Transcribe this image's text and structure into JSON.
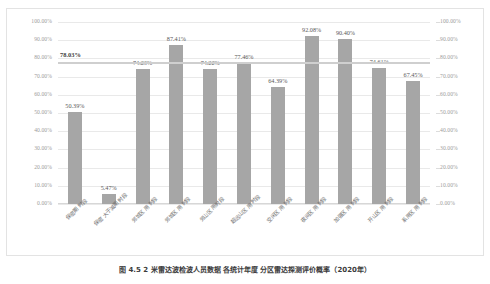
{
  "chart_data": {
    "type": "bar",
    "title": "",
    "xlabel": "",
    "ylabel": "",
    "ylim": [
      0,
      100
    ],
    "y_right_lim": [
      0,
      100
    ],
    "grid": true,
    "legend": "none",
    "value_suffix": "%",
    "categories": [
      "保密期 时段",
      "保密 大于减期 时段",
      "郊城区 用 时段",
      "郊城区 用 时段",
      "郊山区 用时段",
      "超远山区 用 时段",
      "空闲区 用 时段",
      "夜间区 用 时段",
      "加强区 用 时段",
      "开山区 用 时段",
      "系用区 用 时段"
    ],
    "values": [
      50.39,
      5.47,
      74.23,
      87.41,
      74.22,
      77.46,
      64.39,
      92.08,
      90.4,
      74.61,
      67.45
    ],
    "value_labels": [
      "50.39%",
      "5.47%",
      "74.23%",
      "87.41%",
      "74.22%",
      "77.46%",
      "64.39%",
      "92.08%",
      "90.40%",
      "74.61%",
      "67.45%"
    ],
    "y_ticks": [
      0,
      10,
      20,
      30,
      40,
      50,
      60,
      70,
      80,
      90,
      100
    ],
    "y_tick_labels": [
      "0.00%",
      "10.00%",
      "20.00%",
      "30.00%",
      "40.00%",
      "50.00%",
      "60.00%",
      "70.00%",
      "80.00%",
      "90.00%",
      "100.00%"
    ],
    "y_right_tick_labels": [
      "0.00%",
      "10.00%",
      "20.00%",
      "30.00%",
      "40.00%",
      "50.00%",
      "60.00%",
      "70.00%",
      "80.00%",
      "90.00%",
      "100.00%"
    ],
    "reference_line": {
      "value": 78.03,
      "label": "78.03%"
    },
    "series": [
      {
        "name": "合格率",
        "type": "bar",
        "color": "#a6a6a6",
        "values": [
          50.39,
          5.47,
          74.23,
          87.41,
          74.22,
          77.46,
          64.39,
          92.08,
          90.4,
          74.61,
          67.45
        ]
      },
      {
        "name": "平均线",
        "type": "line",
        "color": "#cfcfcf",
        "value": 78.03
      }
    ]
  },
  "caption": {
    "text": "图 4.5    2 米雷达波检波人员数据 各统计年度 分区雷达探测评价概率（2020年）"
  },
  "colors": {
    "bar": "#a6a6a6",
    "reference_line": "#cfcfcf",
    "gridline": "#e9e9e9",
    "tick_text": "#9b9b9b",
    "label_text": "#5a5a5a"
  }
}
